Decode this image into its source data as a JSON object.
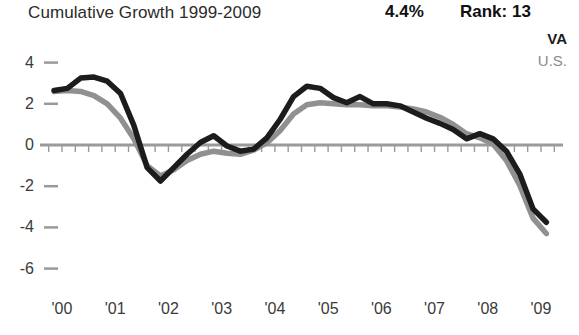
{
  "header": {
    "title": "Cumulative Growth 1999-2009",
    "value": "4.4%",
    "rank": "Rank: 13"
  },
  "legend": {
    "series_va": "VA",
    "series_us": "U.S."
  },
  "chart_data": {
    "type": "line",
    "title": "Cumulative Growth 1999-2009",
    "xlabel": "",
    "ylabel": "",
    "xlim": [
      1999.8,
      2009.3
    ],
    "ylim": [
      -6,
      4
    ],
    "yticks": [
      4,
      2,
      0,
      -2,
      -4,
      -6
    ],
    "ytick_labels": [
      "4",
      "2",
      "0",
      "-2",
      "-4",
      "-6"
    ],
    "xticks": [
      2000,
      2001,
      2002,
      2003,
      2004,
      2005,
      2006,
      2007,
      2008,
      2009
    ],
    "xtick_labels": [
      "'00",
      "'01",
      "'02",
      "'03",
      "'04",
      "'05",
      "'06",
      "'07",
      "'08",
      "'09"
    ],
    "minor_xtick_interval": 0.25,
    "grid": false,
    "zero_line": true,
    "legend_position": "top-right",
    "colors": {
      "va": "#1c1c1c",
      "us": "#909090",
      "axis": "#9a9a9a",
      "text": "#3a3a3a"
    },
    "series": [
      {
        "name": "VA",
        "color": "#1c1c1c",
        "x": [
          1999.85,
          2000.1,
          2000.35,
          2000.6,
          2000.85,
          2001.1,
          2001.35,
          2001.6,
          2001.85,
          2002.1,
          2002.35,
          2002.6,
          2002.85,
          2003.1,
          2003.35,
          2003.6,
          2003.85,
          2004.1,
          2004.35,
          2004.6,
          2004.85,
          2005.1,
          2005.35,
          2005.6,
          2005.85,
          2006.1,
          2006.35,
          2006.6,
          2006.85,
          2007.1,
          2007.35,
          2007.6,
          2007.85,
          2008.1,
          2008.35,
          2008.6,
          2008.85,
          2009.1
        ],
        "y": [
          2.65,
          2.75,
          3.25,
          3.3,
          3.1,
          2.5,
          0.95,
          -1.1,
          -1.75,
          -1.1,
          -0.45,
          0.12,
          0.45,
          -0.05,
          -0.3,
          -0.2,
          0.35,
          1.25,
          2.35,
          2.85,
          2.75,
          2.3,
          2.05,
          2.35,
          2.0,
          2.0,
          1.9,
          1.6,
          1.3,
          1.05,
          0.75,
          0.3,
          0.55,
          0.3,
          -0.3,
          -1.4,
          -3.1,
          -3.75
        ]
      },
      {
        "name": "U.S.",
        "color": "#909090",
        "x": [
          1999.85,
          2000.1,
          2000.35,
          2000.6,
          2000.85,
          2001.1,
          2001.35,
          2001.6,
          2001.85,
          2002.1,
          2002.35,
          2002.6,
          2002.85,
          2003.1,
          2003.35,
          2003.6,
          2003.85,
          2004.1,
          2004.35,
          2004.6,
          2004.85,
          2005.1,
          2005.35,
          2005.6,
          2005.85,
          2006.1,
          2006.35,
          2006.6,
          2006.85,
          2007.1,
          2007.35,
          2007.6,
          2007.85,
          2008.1,
          2008.35,
          2008.6,
          2008.85,
          2009.1
        ],
        "y": [
          2.6,
          2.65,
          2.6,
          2.4,
          2.0,
          1.3,
          0.3,
          -1.0,
          -1.5,
          -1.2,
          -0.75,
          -0.45,
          -0.3,
          -0.4,
          -0.45,
          -0.25,
          0.1,
          0.7,
          1.5,
          1.95,
          2.05,
          2.0,
          1.95,
          1.95,
          1.9,
          1.9,
          1.85,
          1.75,
          1.6,
          1.35,
          1.0,
          0.55,
          0.35,
          0.05,
          -0.75,
          -1.95,
          -3.55,
          -4.3
        ]
      }
    ]
  }
}
